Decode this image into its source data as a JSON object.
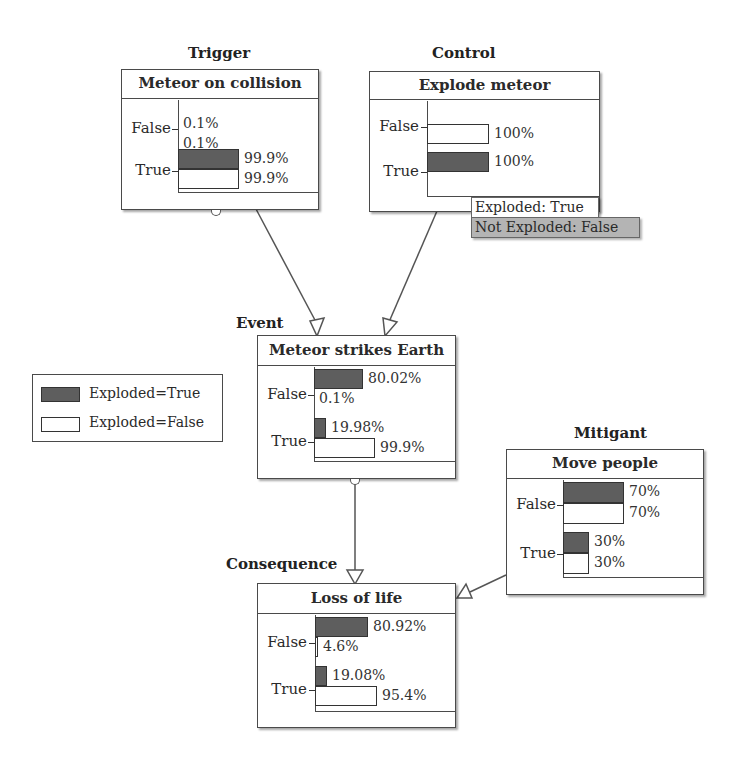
{
  "legend": {
    "items": [
      {
        "label": "Exploded=True",
        "fill": "dark"
      },
      {
        "label": "Exploded=False",
        "fill": "light"
      }
    ]
  },
  "colors": {
    "dark_bar": "#5e5e5e",
    "light_bar": "#ffffff",
    "tooltip_false_bg": "#b4b4b4",
    "border": "#4a4a4a"
  },
  "nodes": {
    "trigger": {
      "role": "Trigger",
      "title": "Meteor on collision",
      "states": [
        {
          "label": "False",
          "exploded_true": 0.1,
          "exploded_true_text": "0.1%",
          "exploded_false": 0.1,
          "exploded_false_text": "0.1%"
        },
        {
          "label": "True",
          "exploded_true": 99.9,
          "exploded_true_text": "99.9%",
          "exploded_false": 99.9,
          "exploded_false_text": "99.9%"
        }
      ]
    },
    "control": {
      "role": "Control",
      "title": "Explode meteor",
      "states": [
        {
          "label": "False",
          "value": 100,
          "value_text": "100%",
          "fill": "light"
        },
        {
          "label": "True",
          "value": 100,
          "value_text": "100%",
          "fill": "dark"
        }
      ],
      "scenario_labels": [
        {
          "text": "Exploded: True",
          "kind": "true"
        },
        {
          "text": "Not Exploded: False",
          "kind": "false"
        }
      ]
    },
    "event": {
      "role": "Event",
      "title": "Meteor strikes Earth",
      "states": [
        {
          "label": "False",
          "exploded_true": 80.02,
          "exploded_true_text": "80.02%",
          "exploded_false": 0.1,
          "exploded_false_text": "0.1%"
        },
        {
          "label": "True",
          "exploded_true": 19.98,
          "exploded_true_text": "19.98%",
          "exploded_false": 99.9,
          "exploded_false_text": "99.9%"
        }
      ]
    },
    "mitigant": {
      "role": "Mitigant",
      "title": "Move people",
      "states": [
        {
          "label": "False",
          "exploded_true": 70,
          "exploded_true_text": "70%",
          "exploded_false": 70,
          "exploded_false_text": "70%"
        },
        {
          "label": "True",
          "exploded_true": 30,
          "exploded_true_text": "30%",
          "exploded_false": 30,
          "exploded_false_text": "30%"
        }
      ]
    },
    "consequence": {
      "role": "Consequence",
      "title": "Loss of life",
      "states": [
        {
          "label": "False",
          "exploded_true": 80.92,
          "exploded_true_text": "80.92%",
          "exploded_false": 4.6,
          "exploded_false_text": "4.6%"
        },
        {
          "label": "True",
          "exploded_true": 19.08,
          "exploded_true_text": "19.08%",
          "exploded_false": 95.4,
          "exploded_false_text": "95.4%"
        }
      ]
    }
  },
  "edges": [
    {
      "from": "trigger",
      "to": "event"
    },
    {
      "from": "control",
      "to": "event"
    },
    {
      "from": "event",
      "to": "consequence"
    },
    {
      "from": "mitigant",
      "to": "consequence"
    }
  ]
}
